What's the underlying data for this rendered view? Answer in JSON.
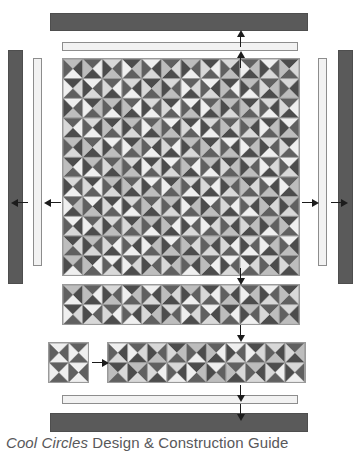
{
  "document": {
    "caption_italic": "Cool Circles",
    "caption_regular": " Design & Construction Guide"
  },
  "colors": {
    "bar_dark": "#5a5a5a",
    "bar_dark_border": "#4e4e4e",
    "bar_light": "#f2f2f2",
    "bar_light_border": "#8d8d8d",
    "grid_line": "#9a9a9a",
    "arrow": "#1c1c1c",
    "caption_text": "#58585a",
    "page_background": "#ffffff"
  },
  "palette": {
    "note": "grayscale fabric values used by the pinwheel triangles",
    "swatches": [
      "#3a3a3a",
      "#4c4c4c",
      "#606060",
      "#7c7c7c",
      "#9a9a9a",
      "#bdbdbd",
      "#d8d8d8",
      "#efefef",
      "#fafafa"
    ]
  },
  "bars": [
    {
      "name": "top-outer-border-strip",
      "tone": "dark",
      "orientation": "horizontal",
      "x": 50,
      "y": 13,
      "w": 258,
      "h": 18
    },
    {
      "name": "top-inner-border-strip",
      "tone": "light",
      "orientation": "horizontal",
      "x": 62,
      "y": 42,
      "w": 236,
      "h": 9
    },
    {
      "name": "left-outer-border-strip",
      "tone": "dark",
      "orientation": "vertical",
      "x": 8,
      "y": 50,
      "w": 15,
      "h": 234
    },
    {
      "name": "left-inner-border-strip",
      "tone": "light",
      "orientation": "vertical",
      "x": 33,
      "y": 58,
      "w": 9,
      "h": 208
    },
    {
      "name": "right-inner-border-strip",
      "tone": "light",
      "orientation": "vertical",
      "x": 318,
      "y": 58,
      "w": 9,
      "h": 208
    },
    {
      "name": "right-outer-border-strip",
      "tone": "dark",
      "orientation": "vertical",
      "x": 338,
      "y": 50,
      "w": 15,
      "h": 234
    },
    {
      "name": "bottom-inner-border-strip",
      "tone": "light",
      "orientation": "horizontal",
      "x": 62,
      "y": 395,
      "w": 236,
      "h": 9
    },
    {
      "name": "bottom-outer-border-strip",
      "tone": "dark",
      "orientation": "horizontal",
      "x": 50,
      "y": 413,
      "w": 258,
      "h": 19
    }
  ],
  "arrows": [
    {
      "name": "arrow-top-to-outer-border",
      "direction": "up",
      "x": 240,
      "y": 31
    },
    {
      "name": "arrow-top-to-inner-border",
      "direction": "up",
      "x": 240,
      "y": 52
    },
    {
      "name": "arrow-left-to-outer-border",
      "direction": "left",
      "x": 12,
      "y": 202
    },
    {
      "name": "arrow-left-to-inner-border",
      "direction": "left",
      "x": 45,
      "y": 202
    },
    {
      "name": "arrow-right-to-inner-border",
      "direction": "right",
      "x": 302,
      "y": 202
    },
    {
      "name": "arrow-right-to-outer-border",
      "direction": "right",
      "x": 331,
      "y": 202
    },
    {
      "name": "arrow-center-to-sashing-strip",
      "direction": "down",
      "x": 240,
      "y": 268
    },
    {
      "name": "arrow-strip-to-block-row",
      "direction": "down",
      "x": 240,
      "y": 325
    },
    {
      "name": "arrow-block-to-strip",
      "direction": "right",
      "x": 92,
      "y": 362
    },
    {
      "name": "arrow-row-to-bottom-inner",
      "direction": "down",
      "x": 240,
      "y": 385
    },
    {
      "name": "arrow-bottom-inner-to-outer",
      "direction": "down",
      "x": 240,
      "y": 404
    }
  ],
  "panels": [
    {
      "name": "main-quilt-top",
      "x": 62,
      "y": 58,
      "cell": 19.666,
      "cols": 12,
      "rows": 11,
      "cells": [
        [
          [
            5,
            1,
            7,
            2
          ],
          [
            2,
            7,
            1,
            5
          ],
          [
            6,
            2,
            5,
            1
          ],
          [
            1,
            5,
            2,
            7
          ],
          [
            7,
            1,
            6,
            2
          ],
          [
            2,
            6,
            1,
            5
          ],
          [
            5,
            2,
            7,
            1
          ],
          [
            1,
            7,
            2,
            6
          ],
          [
            6,
            1,
            5,
            2
          ],
          [
            2,
            5,
            1,
            7
          ],
          [
            7,
            2,
            6,
            1
          ],
          [
            1,
            6,
            2,
            5
          ]
        ],
        [
          [
            1,
            6,
            2,
            7
          ],
          [
            7,
            2,
            6,
            1
          ],
          [
            2,
            7,
            1,
            6
          ],
          [
            6,
            1,
            7,
            2
          ],
          [
            1,
            5,
            2,
            6
          ],
          [
            6,
            2,
            5,
            1
          ],
          [
            2,
            6,
            1,
            7
          ],
          [
            7,
            1,
            6,
            2
          ],
          [
            1,
            7,
            2,
            5
          ],
          [
            5,
            2,
            7,
            1
          ],
          [
            2,
            5,
            1,
            6
          ],
          [
            6,
            1,
            5,
            2
          ]
        ],
        [
          [
            7,
            2,
            5,
            1
          ],
          [
            1,
            5,
            2,
            7
          ],
          [
            5,
            1,
            7,
            2
          ],
          [
            2,
            7,
            1,
            5
          ],
          [
            6,
            2,
            7,
            1
          ],
          [
            1,
            7,
            2,
            6
          ],
          [
            7,
            1,
            5,
            2
          ],
          [
            2,
            5,
            1,
            7
          ],
          [
            5,
            2,
            6,
            1
          ],
          [
            1,
            6,
            2,
            5
          ],
          [
            6,
            1,
            7,
            2
          ],
          [
            2,
            7,
            1,
            6
          ]
        ],
        [
          [
            2,
            7,
            1,
            6
          ],
          [
            6,
            1,
            7,
            2
          ],
          [
            1,
            6,
            2,
            5
          ],
          [
            5,
            2,
            6,
            1
          ],
          [
            2,
            5,
            1,
            7
          ],
          [
            7,
            1,
            5,
            2
          ],
          [
            1,
            7,
            2,
            6
          ],
          [
            6,
            2,
            7,
            1
          ],
          [
            2,
            6,
            1,
            5
          ],
          [
            5,
            1,
            6,
            2
          ],
          [
            1,
            5,
            2,
            7
          ],
          [
            7,
            2,
            5,
            1
          ]
        ],
        [
          [
            5,
            1,
            6,
            2
          ],
          [
            2,
            6,
            1,
            5
          ],
          [
            7,
            2,
            5,
            1
          ],
          [
            1,
            5,
            2,
            7
          ],
          [
            6,
            1,
            7,
            2
          ],
          [
            2,
            7,
            1,
            6
          ],
          [
            5,
            2,
            6,
            1
          ],
          [
            1,
            6,
            2,
            5
          ],
          [
            7,
            1,
            5,
            2
          ],
          [
            2,
            5,
            1,
            7
          ],
          [
            6,
            2,
            7,
            1
          ],
          [
            1,
            7,
            2,
            6
          ]
        ],
        [
          [
            1,
            7,
            2,
            5
          ],
          [
            5,
            2,
            7,
            1
          ],
          [
            2,
            5,
            1,
            6
          ],
          [
            6,
            1,
            5,
            2
          ],
          [
            1,
            6,
            2,
            7
          ],
          [
            7,
            2,
            6,
            1
          ],
          [
            2,
            7,
            1,
            5
          ],
          [
            5,
            1,
            7,
            2
          ],
          [
            1,
            5,
            2,
            6
          ],
          [
            6,
            2,
            5,
            1
          ],
          [
            2,
            6,
            1,
            7
          ],
          [
            7,
            1,
            6,
            2
          ]
        ],
        [
          [
            6,
            2,
            7,
            1
          ],
          [
            1,
            7,
            2,
            6
          ],
          [
            5,
            1,
            6,
            2
          ],
          [
            2,
            6,
            1,
            5
          ],
          [
            7,
            2,
            5,
            1
          ],
          [
            1,
            5,
            2,
            7
          ],
          [
            6,
            1,
            7,
            2
          ],
          [
            2,
            7,
            1,
            6
          ],
          [
            5,
            2,
            6,
            1
          ],
          [
            1,
            6,
            2,
            5
          ],
          [
            7,
            1,
            5,
            2
          ],
          [
            2,
            5,
            1,
            7
          ]
        ],
        [
          [
            2,
            5,
            1,
            7
          ],
          [
            7,
            1,
            5,
            2
          ],
          [
            1,
            7,
            2,
            6
          ],
          [
            6,
            2,
            7,
            1
          ],
          [
            2,
            6,
            1,
            5
          ],
          [
            5,
            1,
            6,
            2
          ],
          [
            1,
            5,
            2,
            7
          ],
          [
            7,
            2,
            5,
            1
          ],
          [
            2,
            7,
            1,
            6
          ],
          [
            6,
            1,
            7,
            2
          ],
          [
            1,
            6,
            2,
            5
          ],
          [
            5,
            2,
            6,
            1
          ]
        ],
        [
          [
            7,
            1,
            6,
            2
          ],
          [
            2,
            6,
            1,
            7
          ],
          [
            6,
            2,
            5,
            1
          ],
          [
            1,
            5,
            2,
            6
          ],
          [
            5,
            1,
            7,
            2
          ],
          [
            2,
            7,
            1,
            5
          ],
          [
            7,
            2,
            6,
            1
          ],
          [
            1,
            6,
            2,
            7
          ],
          [
            6,
            1,
            5,
            2
          ],
          [
            2,
            5,
            1,
            6
          ],
          [
            5,
            2,
            7,
            1
          ],
          [
            1,
            7,
            2,
            5
          ]
        ],
        [
          [
            1,
            6,
            2,
            5
          ],
          [
            5,
            2,
            6,
            1
          ],
          [
            2,
            7,
            1,
            6
          ],
          [
            6,
            1,
            7,
            2
          ],
          [
            1,
            5,
            2,
            7
          ],
          [
            7,
            2,
            5,
            1
          ],
          [
            2,
            6,
            1,
            5
          ],
          [
            5,
            1,
            6,
            2
          ],
          [
            1,
            7,
            2,
            6
          ],
          [
            6,
            2,
            7,
            1
          ],
          [
            2,
            5,
            1,
            7
          ],
          [
            7,
            1,
            5,
            2
          ]
        ],
        [
          [
            5,
            2,
            7,
            1
          ],
          [
            1,
            7,
            2,
            5
          ],
          [
            7,
            1,
            6,
            2
          ],
          [
            2,
            6,
            1,
            7
          ],
          [
            6,
            2,
            5,
            1
          ],
          [
            1,
            5,
            2,
            6
          ],
          [
            5,
            1,
            7,
            2
          ],
          [
            2,
            7,
            1,
            5
          ],
          [
            7,
            2,
            6,
            1
          ],
          [
            1,
            6,
            2,
            7
          ],
          [
            6,
            1,
            5,
            2
          ],
          [
            2,
            5,
            1,
            6
          ]
        ]
      ]
    },
    {
      "name": "sashing-strip-panel",
      "x": 62,
      "y": 284,
      "cell": 19.666,
      "cols": 12,
      "rows": 2,
      "cells": [
        [
          [
            5,
            1,
            7,
            2
          ],
          [
            2,
            7,
            1,
            5
          ],
          [
            6,
            2,
            5,
            1
          ],
          [
            1,
            5,
            2,
            7
          ],
          [
            7,
            1,
            6,
            2
          ],
          [
            2,
            6,
            1,
            5
          ],
          [
            5,
            2,
            7,
            1
          ],
          [
            1,
            7,
            2,
            6
          ],
          [
            6,
            1,
            5,
            2
          ],
          [
            2,
            5,
            1,
            7
          ],
          [
            7,
            2,
            6,
            1
          ],
          [
            1,
            6,
            2,
            5
          ]
        ],
        [
          [
            1,
            6,
            2,
            7
          ],
          [
            7,
            2,
            6,
            1
          ],
          [
            2,
            7,
            1,
            6
          ],
          [
            6,
            1,
            7,
            2
          ],
          [
            1,
            5,
            2,
            6
          ],
          [
            6,
            2,
            5,
            1
          ],
          [
            2,
            6,
            1,
            7
          ],
          [
            7,
            1,
            6,
            2
          ],
          [
            1,
            7,
            2,
            5
          ],
          [
            5,
            2,
            7,
            1
          ],
          [
            2,
            5,
            1,
            6
          ],
          [
            6,
            1,
            5,
            2
          ]
        ]
      ]
    },
    {
      "name": "single-block-panel",
      "x": 48,
      "y": 342,
      "cell": 19.666,
      "cols": 2,
      "rows": 2,
      "cells": [
        [
          [
            7,
            2,
            7,
            2
          ],
          [
            2,
            7,
            2,
            7
          ]
        ],
        [
          [
            2,
            7,
            2,
            7
          ],
          [
            7,
            2,
            7,
            2
          ]
        ]
      ]
    },
    {
      "name": "block-row-panel",
      "x": 107,
      "y": 342,
      "cell": 19.666,
      "cols": 10,
      "rows": 2,
      "cells": [
        [
          [
            7,
            1,
            6,
            2
          ],
          [
            2,
            6,
            1,
            7
          ],
          [
            6,
            2,
            5,
            1
          ],
          [
            1,
            5,
            2,
            6
          ],
          [
            5,
            1,
            7,
            2
          ],
          [
            2,
            7,
            1,
            5
          ],
          [
            7,
            2,
            6,
            1
          ],
          [
            1,
            6,
            2,
            7
          ],
          [
            6,
            1,
            5,
            2
          ],
          [
            2,
            5,
            1,
            6
          ]
        ],
        [
          [
            1,
            6,
            2,
            5
          ],
          [
            5,
            2,
            6,
            1
          ],
          [
            2,
            7,
            1,
            6
          ],
          [
            6,
            1,
            7,
            2
          ],
          [
            1,
            5,
            2,
            7
          ],
          [
            7,
            2,
            5,
            1
          ],
          [
            2,
            6,
            1,
            5
          ],
          [
            5,
            1,
            6,
            2
          ],
          [
            1,
            7,
            2,
            6
          ],
          [
            6,
            2,
            7,
            1
          ]
        ]
      ]
    }
  ]
}
